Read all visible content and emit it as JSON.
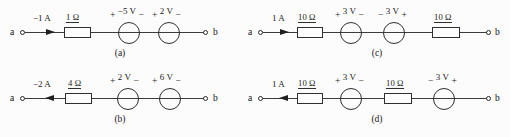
{
  "figure": {
    "terminal_left": "a",
    "terminal_right": "b"
  },
  "circuits": [
    {
      "id": "a",
      "caption": "(a)",
      "current": {
        "label": "−1 A",
        "direction": "right"
      },
      "elements": [
        {
          "type": "resistor",
          "label": "1 Ω"
        },
        {
          "type": "source",
          "left_sign": "+",
          "value": "−5 V",
          "right_sign": "−"
        },
        {
          "type": "source",
          "left_sign": "+",
          "value": "2 V",
          "right_sign": "−"
        }
      ]
    },
    {
      "id": "b",
      "caption": "(b)",
      "current": {
        "label": "−2 A",
        "direction": "left"
      },
      "elements": [
        {
          "type": "resistor",
          "label": "4 Ω"
        },
        {
          "type": "source",
          "left_sign": "+",
          "value": "2 V",
          "right_sign": "−"
        },
        {
          "type": "source",
          "left_sign": "+",
          "value": "6 V",
          "right_sign": "−"
        }
      ]
    },
    {
      "id": "c",
      "caption": "(c)",
      "current": {
        "label": "1 A",
        "direction": "right"
      },
      "elements": [
        {
          "type": "resistor",
          "label": "10 Ω"
        },
        {
          "type": "source",
          "left_sign": "+",
          "value": "3 V",
          "right_sign": "−"
        },
        {
          "type": "source",
          "left_sign": "−",
          "value": "3 V",
          "right_sign": "+"
        },
        {
          "type": "resistor",
          "label": "10 Ω"
        }
      ]
    },
    {
      "id": "d",
      "caption": "(d)",
      "current": {
        "label": "1 A",
        "direction": "left"
      },
      "elements": [
        {
          "type": "resistor",
          "label": "10 Ω"
        },
        {
          "type": "source",
          "left_sign": "+",
          "value": "3 V",
          "right_sign": "−"
        },
        {
          "type": "resistor",
          "label": "10 Ω"
        },
        {
          "type": "source",
          "left_sign": "−",
          "value": "3 V",
          "right_sign": "+"
        }
      ]
    }
  ]
}
